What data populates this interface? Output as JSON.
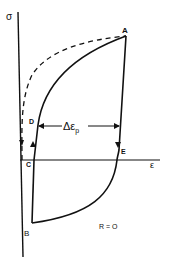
{
  "diagram": {
    "type": "stress-strain hysteresis loop",
    "axes": {
      "y_label": "σ",
      "x_label": "ε"
    },
    "points": {
      "A": "A",
      "B": "B",
      "C": "C",
      "D": "D",
      "E": "E"
    },
    "annotations": {
      "plastic_strain_range_main": "Δε",
      "plastic_strain_range_sub": "p",
      "ratio": "R = O"
    },
    "colors": {
      "line": "#111111",
      "background": "#ffffff"
    }
  }
}
